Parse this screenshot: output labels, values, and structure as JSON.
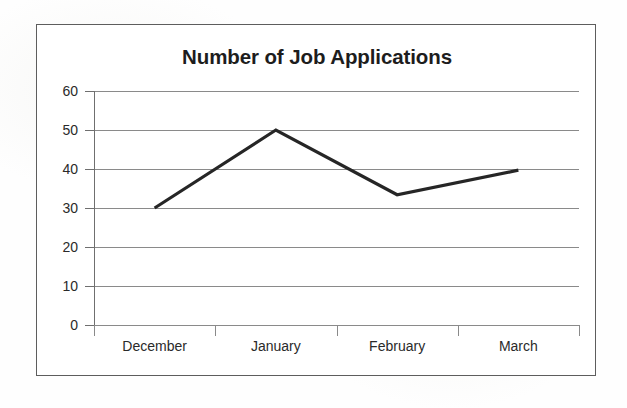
{
  "chart_data": {
    "type": "line",
    "title": "Number of Job Applications",
    "xlabel": "",
    "ylabel": "",
    "categories": [
      "December",
      "January",
      "February",
      "March"
    ],
    "values": [
      30,
      50,
      33.4,
      39.7
    ],
    "series": [
      {
        "name": "Number of Job Applications",
        "values": [
          30,
          50,
          33.4,
          39.7
        ]
      }
    ],
    "ylim": [
      0,
      60
    ],
    "ytick_labels": [
      "0",
      "10",
      "20",
      "30",
      "40",
      "50",
      "60"
    ],
    "ytick_values": [
      0,
      10,
      20,
      30,
      40,
      50,
      60
    ],
    "grid": true,
    "grid_axis": "y",
    "legend": false,
    "legend_position": "none",
    "markers": false,
    "line_color": "#262626",
    "grid_color": "#8a8a8a",
    "axis_color": "#6f6f6f",
    "text_color": "#2a2a2a",
    "background_color": "#ffffff",
    "border_color": "#5d5d5d"
  }
}
